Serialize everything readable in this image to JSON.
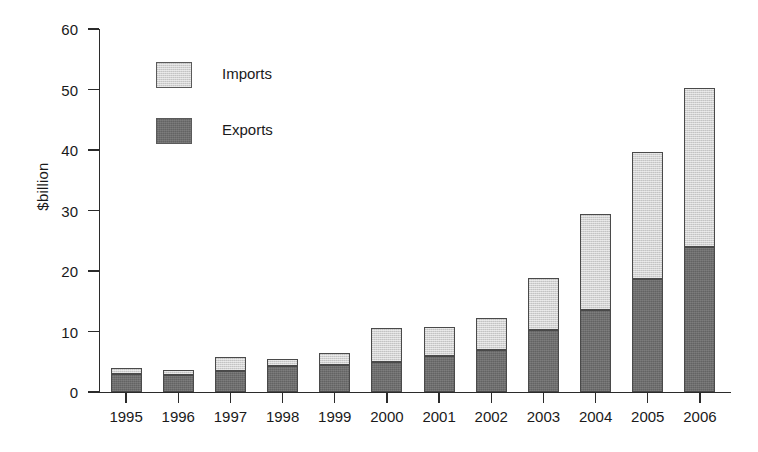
{
  "chart_data": {
    "type": "bar",
    "subtype": "stacked-bar",
    "title": "",
    "xlabel": "",
    "ylabel": "$billion",
    "ylim": [
      0,
      60
    ],
    "yticks": [
      0,
      10,
      20,
      30,
      40,
      50,
      60
    ],
    "ytick_labels": [
      "0",
      "10",
      "20",
      "30",
      "40",
      "50",
      "60"
    ],
    "grid": false,
    "legend_position": "upper-left-inside",
    "categories": [
      "1995",
      "1996",
      "1997",
      "1998",
      "1999",
      "2000",
      "2001",
      "2002",
      "2003",
      "2004",
      "2005",
      "2006"
    ],
    "series": [
      {
        "name": "Exports",
        "color": "#6e6e6e",
        "values": [
          3.0,
          2.8,
          3.5,
          4.3,
          4.4,
          5.0,
          6.0,
          6.9,
          10.2,
          13.6,
          18.6,
          23.9
        ]
      },
      {
        "name": "Imports",
        "color": "#d2d2d2",
        "values": [
          0.9,
          0.8,
          2.3,
          1.2,
          2.1,
          5.6,
          4.8,
          5.3,
          8.6,
          15.8,
          21.1,
          26.4
        ]
      }
    ],
    "totals": [
      3.9,
      3.6,
      5.8,
      5.5,
      6.5,
      10.6,
      10.8,
      12.2,
      18.8,
      29.4,
      39.7,
      50.3
    ],
    "annotations": []
  },
  "legend": {
    "entries": [
      {
        "label": "Imports",
        "swatch_name": "legend-swatch-imports"
      },
      {
        "label": "Exports",
        "swatch_name": "legend-swatch-exports"
      }
    ]
  },
  "axis": {
    "y_title": "$billion"
  }
}
